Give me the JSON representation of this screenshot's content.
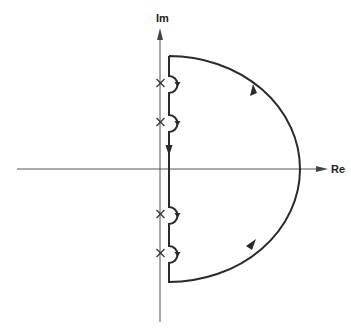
{
  "diagram": {
    "type": "nyquist-contour",
    "axes": {
      "imaginary_label": "Im",
      "real_label": "Re"
    },
    "poles_on_imaginary_axis": {
      "count": 4,
      "marker": "cross-icon"
    },
    "contour": {
      "description": "Closed D-shaped contour: right-half semicircle traversed counterclockwise, with small semicircular indentations to the right of each pole on the imaginary axis",
      "indentations": 4,
      "direction_arrows": 5
    },
    "colors": {
      "axis": "#555555",
      "contour": "#2a2a2a",
      "background": "#ffffff"
    }
  }
}
